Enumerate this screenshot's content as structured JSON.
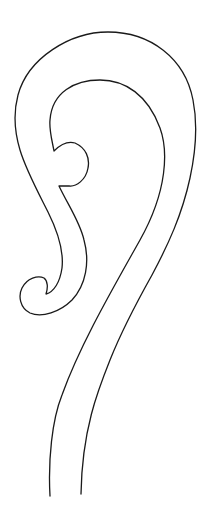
{
  "figure": {
    "background": "#ffffff",
    "stroke_color": "#1a1a1a",
    "width": 212,
    "height": 526
  }
}
